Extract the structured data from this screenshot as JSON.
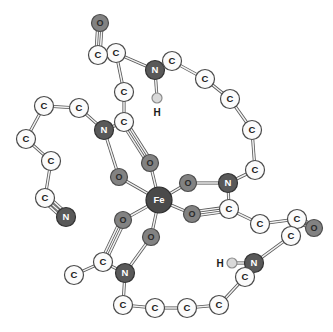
{
  "figure": {
    "kind": "molecular-structure-diagram",
    "background_color": "#ffffff",
    "bond_color": "#555555",
    "bond_fill": "#f2f2f2"
  },
  "element_styles": {
    "C": {
      "fill": "#fbfbfb",
      "stroke": "#4a4a4a",
      "text": "#1a1a1a",
      "radius": 9.5
    },
    "N": {
      "fill": "#595959",
      "stroke": "#333333",
      "text": "#ffffff",
      "radius": 9.5
    },
    "O": {
      "fill": "#828282",
      "stroke": "#4d4d4d",
      "text": "#2b2b2b",
      "radius": 8.5
    },
    "Fe": {
      "fill": "#4a4a4a",
      "stroke": "#2b2b2b",
      "text": "#ffffff",
      "radius": 13
    },
    "H": {
      "fill": "#d9d9d9",
      "stroke": "#8c8c8c",
      "text": "#1a1a1a",
      "radius": 5
    }
  },
  "atoms": [
    {
      "id": "Fe1",
      "el": "Fe",
      "label": "Fe",
      "x": 159,
      "y": 200
    },
    {
      "id": "O1",
      "el": "O",
      "label": "O",
      "x": 150,
      "y": 163
    },
    {
      "id": "O2",
      "el": "O",
      "label": "O",
      "x": 119,
      "y": 177
    },
    {
      "id": "O3",
      "el": "O",
      "label": "O",
      "x": 188,
      "y": 183
    },
    {
      "id": "O4",
      "el": "O",
      "label": "O",
      "x": 192,
      "y": 214
    },
    {
      "id": "O5",
      "el": "O",
      "label": "O",
      "x": 123,
      "y": 220
    },
    {
      "id": "O6",
      "el": "O",
      "label": "O",
      "x": 151,
      "y": 237
    },
    {
      "id": "N1",
      "el": "N",
      "label": "N",
      "x": 104,
      "y": 130
    },
    {
      "id": "C1",
      "el": "C",
      "label": "C",
      "x": 124,
      "y": 122
    },
    {
      "id": "C2",
      "el": "C",
      "label": "C",
      "x": 124,
      "y": 92
    },
    {
      "id": "C3",
      "el": "C",
      "label": "C",
      "x": 116,
      "y": 53
    },
    {
      "id": "C4",
      "el": "C",
      "label": "C",
      "x": 98,
      "y": 55
    },
    {
      "id": "O7",
      "el": "O",
      "label": "O",
      "x": 100,
      "y": 23
    },
    {
      "id": "N2",
      "el": "N",
      "label": "N",
      "x": 155,
      "y": 70
    },
    {
      "id": "H1",
      "el": "H",
      "label": "H",
      "x": 157,
      "y": 98,
      "label_dx": 0,
      "label_dy": 14
    },
    {
      "id": "C5",
      "el": "C",
      "label": "C",
      "x": 172,
      "y": 61
    },
    {
      "id": "C6",
      "el": "C",
      "label": "C",
      "x": 205,
      "y": 79
    },
    {
      "id": "C7",
      "el": "C",
      "label": "C",
      "x": 230,
      "y": 99
    },
    {
      "id": "C8",
      "el": "C",
      "label": "C",
      "x": 252,
      "y": 130
    },
    {
      "id": "C9",
      "el": "C",
      "label": "C",
      "x": 255,
      "y": 170
    },
    {
      "id": "N3",
      "el": "N",
      "label": "N",
      "x": 228,
      "y": 183
    },
    {
      "id": "C10",
      "el": "C",
      "label": "C",
      "x": 229,
      "y": 209
    },
    {
      "id": "C11",
      "el": "C",
      "label": "C",
      "x": 260,
      "y": 224
    },
    {
      "id": "C12",
      "el": "C",
      "label": "C",
      "x": 297,
      "y": 219
    },
    {
      "id": "O8",
      "el": "O",
      "label": "O",
      "x": 314,
      "y": 228
    },
    {
      "id": "C13",
      "el": "C",
      "label": "C",
      "x": 291,
      "y": 236
    },
    {
      "id": "N4",
      "el": "N",
      "label": "N",
      "x": 254,
      "y": 263
    },
    {
      "id": "H2",
      "el": "H",
      "label": "H",
      "x": 232,
      "y": 263,
      "label_dx": -12,
      "label_dy": 0
    },
    {
      "id": "C14",
      "el": "C",
      "label": "C",
      "x": 245,
      "y": 277
    },
    {
      "id": "C15",
      "el": "C",
      "label": "C",
      "x": 219,
      "y": 305
    },
    {
      "id": "C16",
      "el": "C",
      "label": "C",
      "x": 187,
      "y": 308
    },
    {
      "id": "C17",
      "el": "C",
      "label": "C",
      "x": 155,
      "y": 308
    },
    {
      "id": "C18",
      "el": "C",
      "label": "C",
      "x": 123,
      "y": 305
    },
    {
      "id": "N5",
      "el": "N",
      "label": "N",
      "x": 125,
      "y": 273
    },
    {
      "id": "C19",
      "el": "C",
      "label": "C",
      "x": 103,
      "y": 262
    },
    {
      "id": "C20",
      "el": "C",
      "label": "C",
      "x": 74,
      "y": 275
    },
    {
      "id": "C21",
      "el": "C",
      "label": "C",
      "x": 79,
      "y": 108
    },
    {
      "id": "C22",
      "el": "C",
      "label": "C",
      "x": 44,
      "y": 106
    },
    {
      "id": "C23",
      "el": "C",
      "label": "C",
      "x": 26,
      "y": 139
    },
    {
      "id": "C24",
      "el": "C",
      "label": "C",
      "x": 51,
      "y": 161
    },
    {
      "id": "C25",
      "el": "C",
      "label": "C",
      "x": 45,
      "y": 198
    },
    {
      "id": "N6",
      "el": "N",
      "label": "N",
      "x": 66,
      "y": 217
    }
  ],
  "bonds": [
    {
      "a": "Fe1",
      "b": "O1",
      "order": 1
    },
    {
      "a": "Fe1",
      "b": "O2",
      "order": 1
    },
    {
      "a": "Fe1",
      "b": "O3",
      "order": 1
    },
    {
      "a": "Fe1",
      "b": "O4",
      "order": 1
    },
    {
      "a": "Fe1",
      "b": "O5",
      "order": 1
    },
    {
      "a": "Fe1",
      "b": "O6",
      "order": 1
    },
    {
      "a": "O1",
      "b": "C1",
      "order": 2
    },
    {
      "a": "O2",
      "b": "N1",
      "order": 1
    },
    {
      "a": "N1",
      "b": "C1",
      "order": 1
    },
    {
      "a": "C1",
      "b": "C2",
      "order": 1
    },
    {
      "a": "C2",
      "b": "C3",
      "order": 1
    },
    {
      "a": "C3",
      "b": "C4",
      "order": 1
    },
    {
      "a": "C4",
      "b": "O7",
      "order": 2
    },
    {
      "a": "C3",
      "b": "N2",
      "order": 1
    },
    {
      "a": "N2",
      "b": "H1",
      "order": 1
    },
    {
      "a": "N2",
      "b": "C5",
      "order": 1
    },
    {
      "a": "C5",
      "b": "C6",
      "order": 1
    },
    {
      "a": "C6",
      "b": "C7",
      "order": 1
    },
    {
      "a": "C7",
      "b": "C8",
      "order": 1
    },
    {
      "a": "C8",
      "b": "C9",
      "order": 1
    },
    {
      "a": "C9",
      "b": "N3",
      "order": 1
    },
    {
      "a": "N3",
      "b": "O3",
      "order": 1
    },
    {
      "a": "N3",
      "b": "C10",
      "order": 1
    },
    {
      "a": "C10",
      "b": "O4",
      "order": 2
    },
    {
      "a": "C10",
      "b": "C11",
      "order": 1
    },
    {
      "a": "C11",
      "b": "C12",
      "order": 1
    },
    {
      "a": "C12",
      "b": "O8",
      "order": 2
    },
    {
      "a": "C12",
      "b": "C13",
      "order": 1
    },
    {
      "a": "C13",
      "b": "N4",
      "order": 1
    },
    {
      "a": "N4",
      "b": "H2",
      "order": 1
    },
    {
      "a": "N4",
      "b": "C14",
      "order": 1
    },
    {
      "a": "C14",
      "b": "C15",
      "order": 1
    },
    {
      "a": "C15",
      "b": "C16",
      "order": 1
    },
    {
      "a": "C16",
      "b": "C17",
      "order": 1
    },
    {
      "a": "C17",
      "b": "C18",
      "order": 1
    },
    {
      "a": "C18",
      "b": "N5",
      "order": 1
    },
    {
      "a": "N5",
      "b": "O6",
      "order": 1
    },
    {
      "a": "N5",
      "b": "C19",
      "order": 1
    },
    {
      "a": "C19",
      "b": "O5",
      "order": 2
    },
    {
      "a": "C19",
      "b": "C20",
      "order": 1
    },
    {
      "a": "N1",
      "b": "C21",
      "order": 1
    },
    {
      "a": "C21",
      "b": "C22",
      "order": 1
    },
    {
      "a": "C22",
      "b": "C23",
      "order": 1
    },
    {
      "a": "C23",
      "b": "C24",
      "order": 1
    },
    {
      "a": "C24",
      "b": "C25",
      "order": 1
    },
    {
      "a": "C25",
      "b": "N6",
      "order": 3
    }
  ]
}
